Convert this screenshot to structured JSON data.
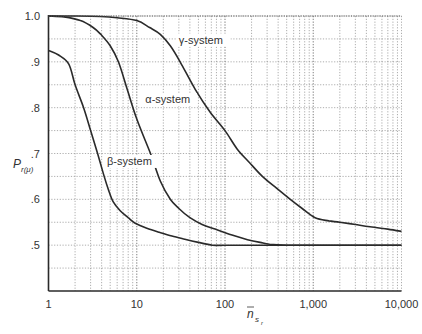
{
  "chart_data": {
    "type": "line",
    "title": "",
    "xlabel": "n̄_{s_r}",
    "ylabel": "P_{r(μ)}",
    "xscale": "log",
    "xlim": [
      1,
      10000
    ],
    "ylim": [
      0.4,
      1.0
    ],
    "grid": true,
    "legend": "none (inline curve labels)",
    "x_tick_labels": [
      "1",
      "10",
      "100",
      "1,000",
      "10,000"
    ],
    "x_ticks": [
      1,
      10,
      100,
      1000,
      10000
    ],
    "y_tick_labels": [
      "1.0",
      ".9",
      ".8",
      ".7",
      ".6",
      ".5"
    ],
    "y_ticks": [
      1.0,
      0.9,
      0.8,
      0.7,
      0.6,
      0.5
    ],
    "y_minor_step": 0.05,
    "series": [
      {
        "name": "β-system",
        "label_pos": {
          "x": 4.6,
          "y": 0.675
        },
        "x": [
          1,
          1.3,
          1.7,
          2,
          2.5,
          3,
          3.6,
          4.2,
          4.8,
          5.4,
          6.5,
          8,
          9.6,
          13,
          18,
          25,
          35,
          50,
          72,
          100,
          300,
          1000,
          3000,
          10000
        ],
        "y": [
          0.925,
          0.915,
          0.895,
          0.85,
          0.8,
          0.75,
          0.7,
          0.655,
          0.62,
          0.595,
          0.575,
          0.56,
          0.548,
          0.537,
          0.528,
          0.52,
          0.513,
          0.506,
          0.5,
          0.5,
          0.5,
          0.5,
          0.5,
          0.5
        ]
      },
      {
        "name": "α-system",
        "label_pos": {
          "x": 12.5,
          "y": 0.81
        },
        "x": [
          1,
          1.5,
          2.3,
          3.2,
          3.9,
          5,
          6.2,
          7.8,
          10,
          14.3,
          18.5,
          24,
          30,
          40,
          55,
          77,
          120,
          180,
          250,
          320,
          500,
          1000,
          10000
        ],
        "y": [
          1.0,
          0.998,
          0.99,
          0.975,
          0.96,
          0.935,
          0.9,
          0.84,
          0.775,
          0.7,
          0.64,
          0.6,
          0.58,
          0.56,
          0.545,
          0.535,
          0.522,
          0.512,
          0.506,
          0.502,
          0.5,
          0.5,
          0.5
        ]
      },
      {
        "name": "γ-system",
        "label_pos": {
          "x": 30,
          "y": 0.94
        },
        "x": [
          1,
          2,
          3.9,
          6,
          10,
          14,
          18.5,
          24,
          31,
          46,
          68,
          100,
          137,
          190,
          265,
          380,
          550,
          750,
          1050,
          1500,
          2000,
          3000,
          4400,
          7000,
          10000
        ],
        "y": [
          1.0,
          1.0,
          0.999,
          0.996,
          0.99,
          0.975,
          0.96,
          0.935,
          0.9,
          0.84,
          0.79,
          0.75,
          0.71,
          0.68,
          0.65,
          0.625,
          0.6,
          0.58,
          0.56,
          0.553,
          0.55,
          0.545,
          0.54,
          0.535,
          0.53
        ]
      }
    ]
  }
}
